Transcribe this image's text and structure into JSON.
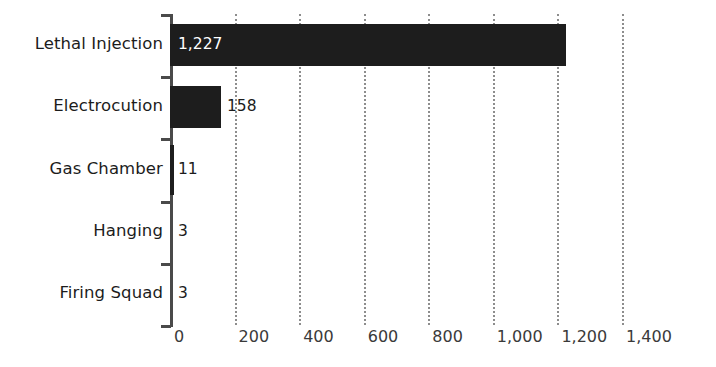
{
  "chart_data": {
    "type": "bar",
    "orientation": "horizontal",
    "title": "",
    "subtitle": "",
    "xlabel": "",
    "ylabel": "",
    "categories": [
      "Lethal Injection",
      "Electrocution",
      "Gas Chamber",
      "Hanging",
      "Firing Squad"
    ],
    "values": [
      1227,
      158,
      11,
      3,
      3
    ],
    "value_labels": [
      "1,227",
      "158",
      "11",
      "3",
      "3"
    ],
    "xlim": [
      0,
      1400
    ],
    "xticks": [
      0,
      200,
      400,
      600,
      800,
      1000,
      1200,
      1400
    ],
    "xtick_labels": [
      "0",
      "200",
      "400",
      "600",
      "800",
      "1,000",
      "1,200",
      "1,400"
    ],
    "grid": true,
    "grid_axis": "x",
    "grid_style": "dotted",
    "legend": null,
    "bar_color": "#1d1d1d",
    "inside_label_color": "#ffffff",
    "outside_label_color": "#1c1c1c",
    "grid_color": "#8d8d8d",
    "axis_color": "#4a4a4a",
    "background_color": "#ffffff"
  }
}
